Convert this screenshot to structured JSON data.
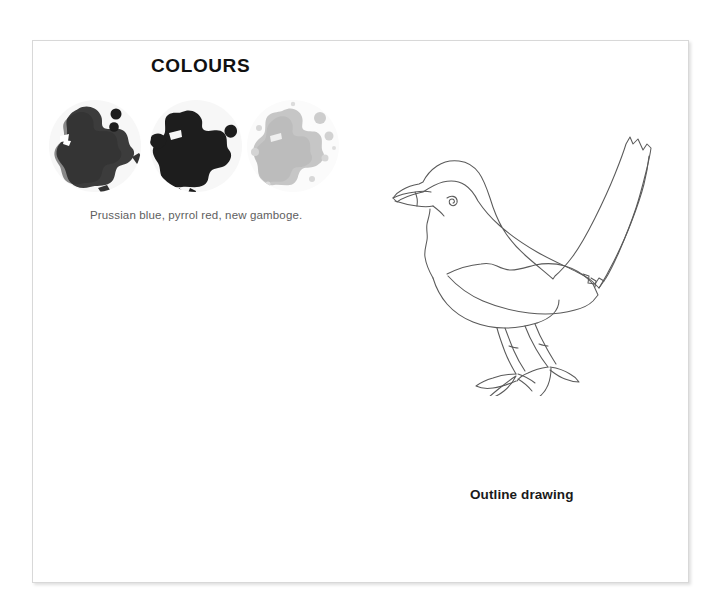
{
  "page": {
    "background_color": "#ffffff",
    "sheet_color": "#ffffff",
    "border_color": "#d8d8d8"
  },
  "colours_section": {
    "heading": "COLOURS",
    "caption": "Prussian blue, pyrrol red, new gamboge.",
    "swatches": [
      {
        "name": "Prussian blue",
        "blob_color": "#3a3a3a",
        "circle_color": "#f6f6f6",
        "tone": "dark"
      },
      {
        "name": "pyrrol red",
        "blob_color": "#1f1f1f",
        "circle_color": "#f6f6f6",
        "tone": "very-dark"
      },
      {
        "name": "new gamboge",
        "blob_color": "#c4c4c4",
        "circle_color": "#fafafa",
        "tone": "light"
      }
    ]
  },
  "drawing_section": {
    "label": "Outline drawing",
    "subject": "blackbird",
    "line_color": "#5a5a5a"
  }
}
